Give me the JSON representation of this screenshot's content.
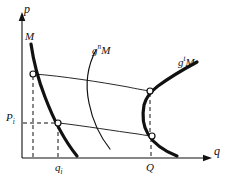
{
  "figure": {
    "title": "",
    "background_color": "#ffffff",
    "ink_color": "#111111",
    "width": 230,
    "height": 182
  },
  "axes": {
    "vertical": {
      "name": "p-axis",
      "label": "p",
      "arrow": true,
      "origin_x": 22,
      "top_y": 14,
      "bottom_y": 158
    },
    "horizontal": {
      "name": "q-axis",
      "label": "q",
      "arrow": true,
      "origin_y": 158,
      "left_x": 22,
      "right_x": 212
    }
  },
  "curve_labels": {
    "initial_set": {
      "text": "M",
      "superscript": ""
    },
    "middle_iterate": {
      "text": "g",
      "superscript": "n",
      "trailing": "M"
    },
    "right_iterate": {
      "text": "g",
      "superscript": "t",
      "trailing": "M"
    }
  },
  "tick_labels": {
    "price": {
      "base": "P",
      "subscript": "i"
    },
    "quantity_small": {
      "base": "q",
      "subscript": "i"
    },
    "quantity_large": {
      "base": "Q",
      "subscript": ""
    }
  },
  "markers": [
    {
      "name": "upper-left-point",
      "x": 33,
      "y": 74
    },
    {
      "name": "lower-left-point",
      "x": 58,
      "y": 123
    },
    {
      "name": "upper-right-point",
      "x": 150,
      "y": 91
    },
    {
      "name": "lower-right-point",
      "x": 152,
      "y": 136
    }
  ],
  "guides": {
    "dashed_vertical_qi_upper": {
      "x": 33,
      "from_y": 74,
      "to_y": 158
    },
    "dashed_vertical_qi_lower": {
      "x": 58,
      "from_y": 123,
      "to_y": 158
    },
    "dashed_horizontal_price": {
      "y": 123,
      "from_x": 22,
      "to_x": 58
    },
    "dashed_vertical_Q_upper": {
      "x": 150,
      "from_y": 91,
      "to_y": 158
    },
    "dashed_vertical_Q_lower": {
      "x": 152,
      "from_y": 136,
      "to_y": 158
    }
  },
  "paths": {
    "curve_M": "M31,44 C33,58 37,76 46,99 C54,120 64,140 76,155",
    "curve_gnM": "M96,50 C88,64 86,82 90,101 C94,122 102,138 110,149",
    "curve_gtM_upper": "M196,63 C183,70 169,78 158,86 C152,91 148,95 146,100",
    "curve_gtM_lower": "M146,100 C143,110 143,122 147,131 C152,142 162,150 176,156",
    "thin_arc_upper": "M33,74 C62,76 100,82 128,87 C137,89 144,90 150,91",
    "thin_arc_lower": "M58,123 C85,126 115,131 138,134 C144,135 149,136 152,136"
  }
}
